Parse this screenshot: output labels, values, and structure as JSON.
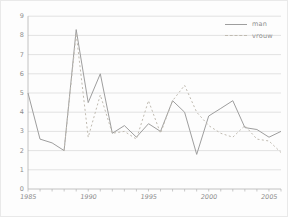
{
  "chart_data": {
    "type": "line",
    "title": "",
    "xlabel": "",
    "ylabel": "",
    "xlim": [
      1985,
      2006
    ],
    "ylim": [
      0,
      9
    ],
    "xticks_labeled": [
      1985,
      1990,
      1995,
      2000,
      2005
    ],
    "yticks": [
      0,
      1,
      2,
      3,
      4,
      5,
      6,
      7,
      8,
      9
    ],
    "grid": true,
    "legend_position": "top-right",
    "series": [
      {
        "name": "man",
        "style": "solid",
        "color": "#9e9e9e",
        "x": [
          1985,
          1986,
          1987,
          1988,
          1989,
          1990,
          1991,
          1992,
          1993,
          1994,
          1995,
          1996,
          1997,
          1998,
          1999,
          2000,
          2001,
          2002,
          2003,
          2004,
          2005,
          2006
        ],
        "values": [
          5.0,
          2.6,
          2.4,
          2.0,
          8.3,
          4.5,
          6.0,
          2.9,
          3.3,
          2.7,
          3.4,
          3.0,
          4.6,
          4.0,
          1.8,
          3.8,
          4.2,
          4.6,
          3.2,
          3.1,
          2.7,
          3.0
        ]
      },
      {
        "name": "vrouw",
        "style": "dashed",
        "color": "#c0bbb1",
        "x": [
          1988,
          1989,
          1990,
          1991,
          1992,
          1993,
          1994,
          1995,
          1996,
          1997,
          1998,
          1999,
          2000,
          2001,
          2002,
          2003,
          2004,
          2005,
          2006
        ],
        "values": [
          2.0,
          8.1,
          2.7,
          4.9,
          2.9,
          3.0,
          2.6,
          4.6,
          2.9,
          4.6,
          5.4,
          4.0,
          3.3,
          2.9,
          2.7,
          3.3,
          2.6,
          2.5,
          1.9
        ]
      }
    ]
  },
  "style": {
    "grid_color": "#d9d9d9",
    "axis_color": "#b3b3b3",
    "tick_label_color": "#8d8d8d",
    "background": "#fdfdfd"
  }
}
